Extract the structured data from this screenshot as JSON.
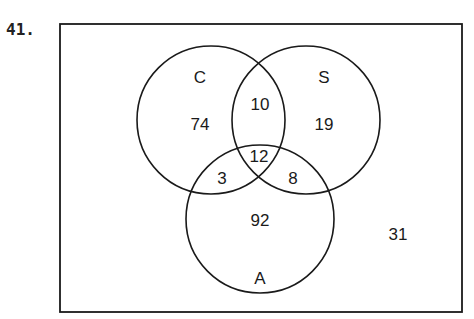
{
  "problem": {
    "number": "41."
  },
  "diagram": {
    "type": "venn",
    "sets": [
      {
        "label": "C",
        "only": "74"
      },
      {
        "label": "S",
        "only": "19"
      },
      {
        "label": "A",
        "only": "92"
      }
    ],
    "regions": {
      "c_s_only": "10",
      "c_a_only": "3",
      "s_a_only": "8",
      "c_s_a": "12",
      "outside": "31"
    },
    "colors": {
      "stroke": "#1a1a1a",
      "background": "#ffffff"
    }
  }
}
